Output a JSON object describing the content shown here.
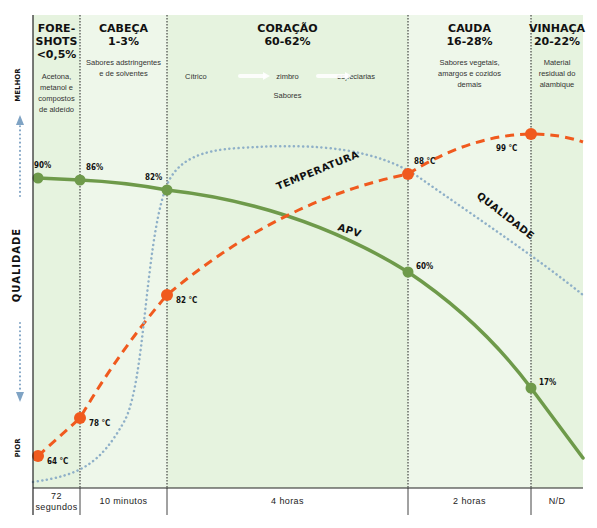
{
  "chart_data": {
    "type": "line",
    "title": "",
    "ylabel": "QUALIDADE",
    "y_top_label": "MELHOR",
    "y_bottom_label": "PIOR",
    "xlabel": "",
    "phases": [
      {
        "key": "foreshots",
        "title_lines": [
          "FORE-",
          "SHOTS",
          "<0,5%"
        ],
        "desc_lines": [
          "Acetona,",
          "metanol e",
          "compostos",
          "de aldeído"
        ],
        "duration_lines": [
          "72",
          "segundos"
        ],
        "highlight": true
      },
      {
        "key": "cabeca",
        "title_lines": [
          "CABEÇA",
          "1-3%"
        ],
        "desc_lines": [
          "Sabores adstringentes",
          "e de solventes"
        ],
        "duration_lines": [
          "10 minutos"
        ],
        "highlight": false
      },
      {
        "key": "coracao",
        "title_lines": [
          "CORAÇÃO",
          "60-62%"
        ],
        "desc_lines": [],
        "duration_lines": [
          "4 horas"
        ],
        "highlight": true,
        "flavor_flow": [
          "Cítrico",
          "zimbro",
          "especiarias"
        ],
        "flavor_caption": "Sabores"
      },
      {
        "key": "cauda",
        "title_lines": [
          "CAUDA",
          "16-28%"
        ],
        "desc_lines": [
          "Sabores vegetais,",
          "amargos e cozidos",
          "demais"
        ],
        "duration_lines": [
          "2 horas"
        ],
        "highlight": false
      },
      {
        "key": "vinhaca",
        "title_lines": [
          "VINHAÇA",
          "20-22%"
        ],
        "desc_lines": [
          "Material",
          "residual do",
          "alambique"
        ],
        "duration_lines": [
          "N/D"
        ],
        "highlight": true
      }
    ],
    "series": [
      {
        "name": "APV",
        "style": "solid",
        "color": "#6e9a4a",
        "points": [
          {
            "boundary": 0.05,
            "value": 90,
            "label": "90%"
          },
          {
            "boundary": 1,
            "value": 86,
            "label": "86%"
          },
          {
            "boundary": 2,
            "value": 82,
            "label": "82%"
          },
          {
            "boundary": 3,
            "value": 60,
            "label": "60%"
          },
          {
            "boundary": 4,
            "value": 17,
            "label": "17%"
          }
        ]
      },
      {
        "name": "TEMPERATURA",
        "style": "dashed",
        "color": "#f05a1e",
        "points": [
          {
            "boundary": 0.05,
            "value": 64,
            "label": "64 °C"
          },
          {
            "boundary": 1,
            "value": 78,
            "label": "78 °C"
          },
          {
            "boundary": 2,
            "value": 82,
            "label": "82 °C"
          },
          {
            "boundary": 3,
            "value": 88,
            "label": "88 °C"
          },
          {
            "boundary": 4,
            "value": 99,
            "label": "99 °C"
          }
        ]
      },
      {
        "name": "QUALIDADE",
        "style": "dotted",
        "color": "#8fb0c8",
        "shape": "low in foreshots, steep rise in cabeça, peak early in coração, gradual decline through cauda and vinhaça"
      }
    ],
    "grid": false,
    "legend": "inline labels on curves"
  }
}
